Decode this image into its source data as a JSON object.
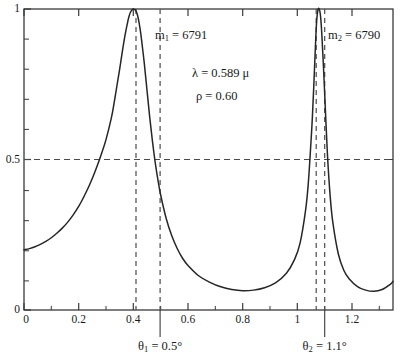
{
  "chart_data": {
    "type": "line",
    "title": "",
    "xlabel": "",
    "ylabel": "",
    "xlim": [
      0,
      1.35
    ],
    "ylim": [
      0,
      1
    ],
    "grid": false,
    "legend": null,
    "x_ticks": [
      "0",
      "0.2",
      "0.4",
      "0.6",
      "0.8",
      "1",
      "1.2"
    ],
    "x_tick_values": [
      0,
      0.2,
      0.4,
      0.6,
      0.8,
      1.0,
      1.2
    ],
    "x_minor_tick_values": [
      0.1,
      0.3,
      0.5,
      0.7,
      0.9,
      1.1,
      1.3
    ],
    "y_ticks": [
      "0",
      "0.5",
      "1"
    ],
    "y_tick_values": [
      0,
      0.5,
      1
    ],
    "y_minor_tick_values": [
      0.1,
      0.2,
      0.3,
      0.4,
      0.6,
      0.7,
      0.8,
      0.9
    ],
    "series": [
      {
        "name": "transmission",
        "description": "Airy transmission function with two interference order peaks",
        "x": [
          0.0,
          0.02,
          0.04,
          0.06,
          0.08,
          0.1,
          0.12,
          0.14,
          0.16,
          0.18,
          0.2,
          0.22,
          0.24,
          0.26,
          0.28,
          0.3,
          0.32,
          0.33,
          0.34,
          0.35,
          0.36,
          0.37,
          0.38,
          0.385,
          0.39,
          0.395,
          0.4,
          0.405,
          0.41,
          0.415,
          0.42,
          0.425,
          0.43,
          0.44,
          0.45,
          0.46,
          0.47,
          0.48,
          0.49,
          0.5,
          0.52,
          0.54,
          0.56,
          0.58,
          0.6,
          0.64,
          0.68,
          0.72,
          0.76,
          0.8,
          0.84,
          0.88,
          0.92,
          0.96,
          0.99,
          1.01,
          1.03,
          1.04,
          1.05,
          1.055,
          1.06,
          1.065,
          1.07,
          1.075,
          1.08,
          1.085,
          1.09,
          1.095,
          1.1,
          1.11,
          1.12,
          1.13,
          1.15,
          1.17,
          1.19,
          1.22,
          1.25,
          1.28,
          1.31,
          1.34,
          1.35
        ],
        "y": [
          0.2,
          0.204,
          0.21,
          0.218,
          0.228,
          0.24,
          0.255,
          0.272,
          0.292,
          0.316,
          0.344,
          0.378,
          0.416,
          0.46,
          0.51,
          0.566,
          0.64,
          0.69,
          0.745,
          0.8,
          0.86,
          0.915,
          0.96,
          0.978,
          0.99,
          0.997,
          1.0,
          0.998,
          0.993,
          0.98,
          0.96,
          0.932,
          0.898,
          0.82,
          0.73,
          0.64,
          0.56,
          0.49,
          0.432,
          0.382,
          0.305,
          0.248,
          0.205,
          0.172,
          0.148,
          0.113,
          0.092,
          0.077,
          0.068,
          0.064,
          0.066,
          0.074,
          0.09,
          0.122,
          0.168,
          0.222,
          0.33,
          0.42,
          0.56,
          0.64,
          0.74,
          0.85,
          0.95,
          0.995,
          1.0,
          0.975,
          0.91,
          0.82,
          0.72,
          0.52,
          0.38,
          0.29,
          0.186,
          0.132,
          0.103,
          0.078,
          0.066,
          0.062,
          0.068,
          0.085,
          0.095
        ]
      }
    ],
    "reference_lines": [
      {
        "name": "half-maximum",
        "orientation": "horizontal",
        "value": 0.5,
        "style": "dashed"
      },
      {
        "name": "peak-1-center",
        "orientation": "vertical",
        "value": 0.41,
        "style": "dashed"
      },
      {
        "name": "theta-1-marker",
        "orientation": "vertical",
        "value": 0.498,
        "style": "dashed"
      },
      {
        "name": "peak-2-center",
        "orientation": "vertical",
        "value": 1.069,
        "style": "dashed"
      },
      {
        "name": "theta-2-marker",
        "orientation": "vertical",
        "value": 1.1,
        "style": "dashed"
      }
    ],
    "annotations": [
      {
        "name": "order-1",
        "text": "m1 = 6791",
        "symbol": "m",
        "subscript": "1",
        "value": "6791",
        "x": 0.5,
        "y": 0.93
      },
      {
        "name": "order-2",
        "text": "m2 = 6790",
        "symbol": "m",
        "subscript": "2",
        "value": "6790",
        "x": 1.15,
        "y": 0.93
      },
      {
        "name": "wavelength",
        "text": "λ = 0.589 μ",
        "x": 0.68,
        "y": 0.79
      },
      {
        "name": "reflectance",
        "text": "ρ = 0.60",
        "x": 0.68,
        "y": 0.7
      },
      {
        "name": "theta-1",
        "text": "θ1 = 0.5°",
        "symbol": "θ",
        "subscript": "1",
        "value": "0.5°",
        "x": 0.498,
        "y": -0.18
      },
      {
        "name": "theta-2",
        "text": "θ2 = 1.1°",
        "symbol": "θ",
        "subscript": "2",
        "value": "1.1°",
        "x": 1.1,
        "y": -0.18
      }
    ]
  },
  "axes": {
    "x_tick_labels": [
      "0",
      "0.2",
      "0.4",
      "0.6",
      "0.8",
      "1",
      "1.2"
    ],
    "y_tick_labels": [
      "1",
      "0.5",
      "0"
    ]
  },
  "annotations": {
    "order_1": {
      "symbol": "m",
      "subscript": "1",
      "equals": " = ",
      "value": "6791"
    },
    "order_2": {
      "symbol": "m",
      "subscript": "2",
      "equals": " = ",
      "value": "6790"
    },
    "wavelength": "λ = 0.589 μ",
    "reflectance": "ρ = 0.60",
    "theta_1": {
      "symbol": "θ",
      "subscript": "1",
      "equals": " = ",
      "value": "0.5°"
    },
    "theta_2": {
      "symbol": "θ",
      "subscript": "2",
      "equals": " = ",
      "value": "1.1°"
    }
  },
  "style": {
    "curve_color": "#262626",
    "axis_color": "#3a3a3a",
    "dash_color": "#4a4a4a",
    "background": "#ffffff"
  }
}
